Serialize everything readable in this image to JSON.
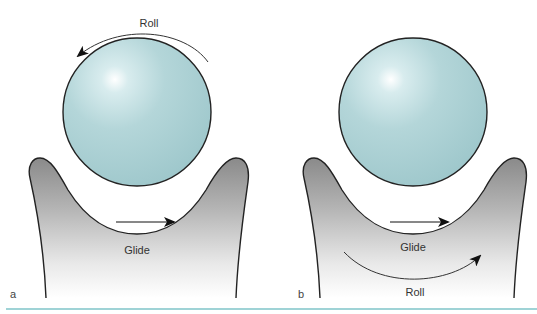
{
  "figure": {
    "panels": [
      {
        "id": "a",
        "panel_label": "a",
        "roll_label": "Roll",
        "glide_label": "Glide",
        "roll_position": "above ball, counter-clockwise arrow",
        "glide_position": "below ball, left-to-right arrow"
      },
      {
        "id": "b",
        "panel_label": "b",
        "roll_label": "Roll",
        "glide_label": "Glide",
        "roll_position": "below socket, left-to-right curved arrow",
        "glide_position": "below ball, left-to-right arrow"
      }
    ],
    "colors": {
      "ball_fill": "#a9cfd2",
      "ball_highlight": "#ffffff",
      "socket_top": "#8f8f8f",
      "socket_bottom": "#ffffff",
      "outline": "#222222",
      "rule": "#9fd3d6"
    }
  }
}
